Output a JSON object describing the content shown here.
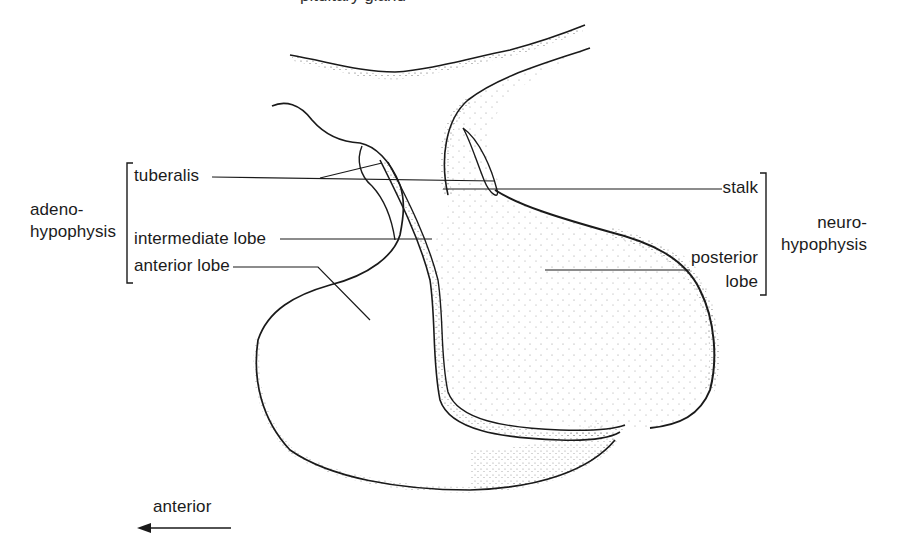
{
  "figure": {
    "caption_cut": "pituitary gland"
  },
  "left_group": {
    "title_line1": "adeno-",
    "title_line2": "hypophysis",
    "items": [
      {
        "label": "tuberalis"
      },
      {
        "label": "intermediate lobe"
      },
      {
        "label": "anterior lobe"
      }
    ]
  },
  "right_group": {
    "title_line1": "neuro-",
    "title_line2": "hypophysis",
    "items": [
      {
        "label": "stalk"
      },
      {
        "label": "posterior"
      },
      {
        "label": "lobe"
      }
    ]
  },
  "orientation": {
    "label": "anterior",
    "arrow": "left-arrow"
  },
  "colors": {
    "ink": "#1a1a1a",
    "background": "#ffffff"
  }
}
